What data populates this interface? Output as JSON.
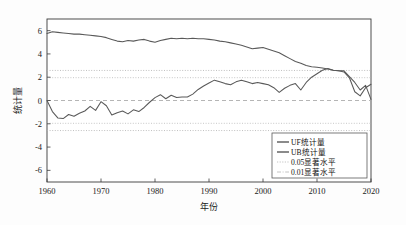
{
  "chart_data": {
    "type": "line",
    "title": "",
    "xlabel": "年份",
    "ylabel": "统计量",
    "xlim": [
      1960,
      2020
    ],
    "ylim": [
      -7,
      7
    ],
    "xticks": [
      1960,
      1970,
      1980,
      1990,
      2000,
      2010,
      2020
    ],
    "yticks": [
      -6,
      -4,
      -2,
      0,
      2,
      4,
      6
    ],
    "grid": false,
    "legend_position": "lower-right",
    "x": [
      1960,
      1961,
      1962,
      1963,
      1964,
      1965,
      1966,
      1967,
      1968,
      1969,
      1970,
      1971,
      1972,
      1973,
      1974,
      1975,
      1976,
      1977,
      1978,
      1979,
      1980,
      1981,
      1982,
      1983,
      1984,
      1985,
      1986,
      1987,
      1988,
      1989,
      1990,
      1991,
      1992,
      1993,
      1994,
      1995,
      1996,
      1997,
      1998,
      1999,
      2000,
      2001,
      2002,
      2003,
      2004,
      2005,
      2006,
      2007,
      2008,
      2009,
      2010,
      2011,
      2012,
      2013,
      2014,
      2015,
      2016,
      2017,
      2018,
      2019,
      2020
    ],
    "series": [
      {
        "name": "UF统计量",
        "color": "#595959",
        "style": "solid",
        "values": [
          0.0,
          -0.95,
          -1.5,
          -1.55,
          -1.2,
          -1.35,
          -1.1,
          -0.9,
          -0.5,
          -0.85,
          -0.1,
          -0.45,
          -1.25,
          -1.05,
          -0.9,
          -1.15,
          -0.8,
          -0.95,
          -0.6,
          -0.15,
          0.25,
          0.5,
          0.15,
          0.45,
          0.25,
          0.3,
          0.3,
          0.55,
          0.95,
          1.25,
          1.5,
          1.75,
          1.6,
          1.45,
          1.35,
          1.6,
          1.75,
          1.6,
          1.45,
          1.55,
          1.45,
          1.35,
          1.1,
          0.7,
          1.05,
          1.3,
          1.45,
          0.9,
          1.55,
          2.0,
          2.3,
          2.6,
          2.75,
          2.6,
          2.55,
          2.45,
          1.95,
          0.75,
          0.4,
          1.1,
          1.4
        ]
      },
      {
        "name": "UB统计量",
        "color": "#595959",
        "style": "solid",
        "values": [
          5.75,
          5.9,
          5.85,
          5.8,
          5.75,
          5.7,
          5.7,
          5.65,
          5.6,
          5.55,
          5.5,
          5.4,
          5.25,
          5.1,
          5.05,
          5.15,
          5.1,
          5.2,
          5.25,
          5.1,
          5.0,
          5.15,
          5.25,
          5.35,
          5.3,
          5.35,
          5.3,
          5.35,
          5.3,
          5.3,
          5.25,
          5.2,
          5.1,
          5.05,
          4.95,
          4.85,
          4.75,
          4.6,
          4.45,
          4.5,
          4.55,
          4.4,
          4.25,
          4.1,
          3.85,
          3.6,
          3.35,
          3.2,
          3.0,
          2.9,
          2.85,
          2.8,
          2.7,
          2.6,
          2.55,
          2.55,
          2.05,
          1.55,
          0.9,
          1.3,
          0.1
        ]
      }
    ],
    "threshold_lines": [
      {
        "name": "0.05显著水平",
        "values": [
          1.96,
          -1.96
        ],
        "color": "#b9b9b9",
        "style": "dotted"
      },
      {
        "name": "0.01显著水平",
        "values": [
          2.58,
          -2.58
        ],
        "color": "#b0b0b0",
        "style": "dotted"
      },
      {
        "name": "zero-line",
        "values": [
          0
        ],
        "color": "#a8a8a8",
        "style": "dashed"
      }
    ],
    "legend": [
      {
        "label": "UF统计量",
        "marker": "solid-line",
        "color": "#595959"
      },
      {
        "label": "UB统计量",
        "marker": "solid-line",
        "color": "#595959"
      },
      {
        "label": "0.05显著水平",
        "marker": "dotted-line",
        "color": "#bdbdbd"
      },
      {
        "label": "0.01显著水平",
        "marker": "dashdot-line",
        "color": "#bdbdbd"
      }
    ]
  }
}
